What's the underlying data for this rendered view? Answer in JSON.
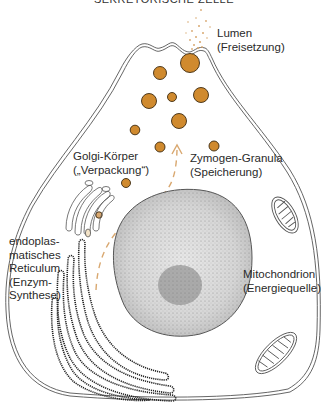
{
  "title": "SEKRETORISCHE ZELLE",
  "colors": {
    "granule": "#D08A2E",
    "granule_stroke": "#4a3210",
    "outline": "#444444",
    "arrow": "#D9A870",
    "text": "#2a2a2a"
  },
  "labels": {
    "lumen": {
      "line1": "Lumen",
      "line2": "(Freisetzung)"
    },
    "golgi": {
      "line1": "Golgi-Körper",
      "line2": "(„Verpackung“)"
    },
    "zymogen": {
      "line1": "Zymogen-Granula",
      "line2": "(Speicherung)"
    },
    "er": {
      "line1": "endoplas-",
      "line2": "matisches",
      "line3": "Reticulum",
      "line4": "(Enzym-",
      "line5": "Synthese)"
    },
    "mito": {
      "line1": "Mitochondrion",
      "line2": "(Energiequelle)"
    }
  }
}
